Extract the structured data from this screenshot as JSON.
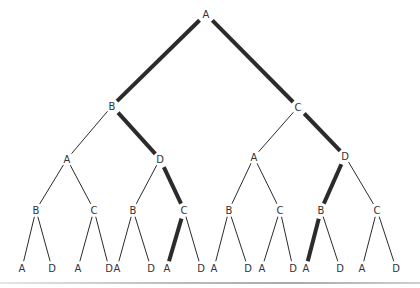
{
  "diagram": {
    "type": "binary-tree",
    "colors": {
      "edge": "#2b2b2b",
      "label": "#333333",
      "rule": "#b0b0b0"
    },
    "nodes": [
      {
        "id": "n0",
        "label": "A",
        "x": 206,
        "y": 14
      },
      {
        "id": "n1",
        "label": "B",
        "x": 112,
        "y": 106
      },
      {
        "id": "n2",
        "label": "C",
        "x": 298,
        "y": 107
      },
      {
        "id": "n3",
        "label": "A",
        "x": 67,
        "y": 159
      },
      {
        "id": "n4",
        "label": "D",
        "x": 160,
        "y": 159
      },
      {
        "id": "n5",
        "label": "A",
        "x": 254,
        "y": 157
      },
      {
        "id": "n6",
        "label": "D",
        "x": 345,
        "y": 156
      },
      {
        "id": "n7",
        "label": "B",
        "x": 36,
        "y": 210
      },
      {
        "id": "n8",
        "label": "C",
        "x": 94,
        "y": 210
      },
      {
        "id": "n9",
        "label": "B",
        "x": 133,
        "y": 210
      },
      {
        "id": "n10",
        "label": "C",
        "x": 184,
        "y": 210
      },
      {
        "id": "n11",
        "label": "B",
        "x": 229,
        "y": 210
      },
      {
        "id": "n12",
        "label": "C",
        "x": 280,
        "y": 210
      },
      {
        "id": "n13",
        "label": "B",
        "x": 321,
        "y": 210
      },
      {
        "id": "n14",
        "label": "C",
        "x": 377,
        "y": 210
      },
      {
        "id": "n15",
        "label": "A",
        "x": 22,
        "y": 268
      },
      {
        "id": "n16",
        "label": "D",
        "x": 52,
        "y": 268
      },
      {
        "id": "n17",
        "label": "A",
        "x": 78,
        "y": 268
      },
      {
        "id": "n18",
        "label": "D",
        "x": 109,
        "y": 268
      },
      {
        "id": "n19",
        "label": "A",
        "x": 117,
        "y": 268
      },
      {
        "id": "n20",
        "label": "D",
        "x": 151,
        "y": 268
      },
      {
        "id": "n21",
        "label": "A",
        "x": 167,
        "y": 268
      },
      {
        "id": "n22",
        "label": "D",
        "x": 201,
        "y": 268
      },
      {
        "id": "n23",
        "label": "A",
        "x": 214,
        "y": 268
      },
      {
        "id": "n24",
        "label": "D",
        "x": 248,
        "y": 268
      },
      {
        "id": "n25",
        "label": "A",
        "x": 262,
        "y": 268
      },
      {
        "id": "n26",
        "label": "D",
        "x": 293,
        "y": 268
      },
      {
        "id": "n27",
        "label": "A",
        "x": 306,
        "y": 268
      },
      {
        "id": "n28",
        "label": "D",
        "x": 340,
        "y": 268
      },
      {
        "id": "n29",
        "label": "A",
        "x": 362,
        "y": 268
      },
      {
        "id": "n30",
        "label": "D",
        "x": 396,
        "y": 268
      }
    ],
    "edges": [
      {
        "from": "n0",
        "to": "n1",
        "thick": true
      },
      {
        "from": "n0",
        "to": "n2",
        "thick": true
      },
      {
        "from": "n1",
        "to": "n3",
        "thick": false
      },
      {
        "from": "n1",
        "to": "n4",
        "thick": true
      },
      {
        "from": "n2",
        "to": "n5",
        "thick": false
      },
      {
        "from": "n2",
        "to": "n6",
        "thick": true
      },
      {
        "from": "n3",
        "to": "n7",
        "thick": false
      },
      {
        "from": "n3",
        "to": "n8",
        "thick": false
      },
      {
        "from": "n4",
        "to": "n9",
        "thick": false
      },
      {
        "from": "n4",
        "to": "n10",
        "thick": true
      },
      {
        "from": "n5",
        "to": "n11",
        "thick": false
      },
      {
        "from": "n5",
        "to": "n12",
        "thick": false
      },
      {
        "from": "n6",
        "to": "n13",
        "thick": true
      },
      {
        "from": "n6",
        "to": "n14",
        "thick": false
      },
      {
        "from": "n7",
        "to": "n15",
        "thick": false
      },
      {
        "from": "n7",
        "to": "n16",
        "thick": false
      },
      {
        "from": "n8",
        "to": "n17",
        "thick": false
      },
      {
        "from": "n8",
        "to": "n18",
        "thick": false
      },
      {
        "from": "n9",
        "to": "n19",
        "thick": false
      },
      {
        "from": "n9",
        "to": "n20",
        "thick": false
      },
      {
        "from": "n10",
        "to": "n21",
        "thick": true
      },
      {
        "from": "n10",
        "to": "n22",
        "thick": false
      },
      {
        "from": "n11",
        "to": "n23",
        "thick": false
      },
      {
        "from": "n11",
        "to": "n24",
        "thick": false
      },
      {
        "from": "n12",
        "to": "n25",
        "thick": false
      },
      {
        "from": "n12",
        "to": "n26",
        "thick": false
      },
      {
        "from": "n13",
        "to": "n27",
        "thick": true
      },
      {
        "from": "n13",
        "to": "n28",
        "thick": false
      },
      {
        "from": "n14",
        "to": "n29",
        "thick": false
      },
      {
        "from": "n14",
        "to": "n30",
        "thick": false
      }
    ]
  }
}
